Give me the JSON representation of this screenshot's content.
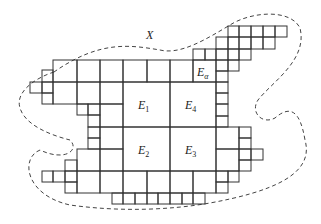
{
  "diagram": {
    "set_label": "X",
    "labels": {
      "e1": {
        "base": "E",
        "sub": "1"
      },
      "e2": {
        "base": "E",
        "sub": "2"
      },
      "e3": {
        "base": "E",
        "sub": "3"
      },
      "e4": {
        "base": "E",
        "sub": "4"
      },
      "ea": {
        "base": "E",
        "sub": "α"
      }
    },
    "colors": {
      "line": "#333333",
      "boundary": "#444444",
      "background": "#ffffff"
    }
  }
}
